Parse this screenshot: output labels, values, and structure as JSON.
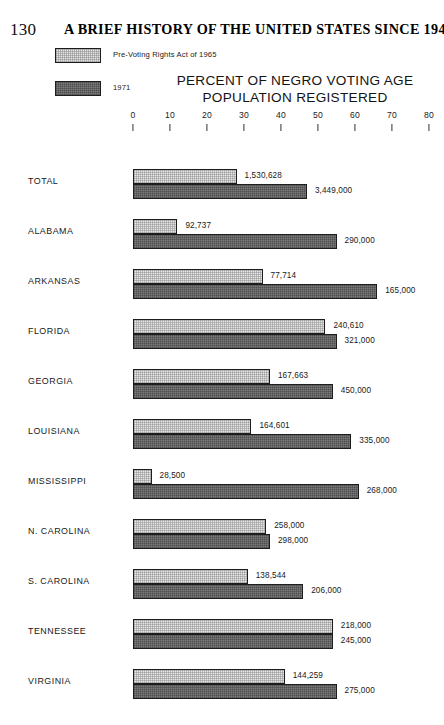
{
  "page": {
    "folio": "130",
    "running_head": "A BRIEF HISTORY OF THE UNITED STATES SINCE 1945"
  },
  "legend": {
    "items": [
      {
        "label": "Pre-Voting Rights Act of 1965",
        "swatch": "light-hatched-swatch"
      },
      {
        "label": "1971",
        "swatch": "dark-hatched-swatch"
      }
    ]
  },
  "chart_data": {
    "type": "bar",
    "orientation": "horizontal",
    "title": "PERCENT OF NEGRO VOTING AGE POPULATION REGISTERED",
    "title_line1": "PERCENT OF NEGRO VOTING AGE",
    "title_line2": "POPULATION REGISTERED",
    "xlabel": "",
    "ylabel": "",
    "xlim": [
      0,
      80
    ],
    "grid": false,
    "legend_position": "top-left",
    "tick_labels": [
      "0",
      "10",
      "20",
      "30",
      "40",
      "50",
      "60",
      "70",
      "80"
    ],
    "ticks": [
      0,
      10,
      20,
      30,
      40,
      50,
      60,
      70,
      80
    ],
    "categories": [
      "TOTAL",
      "ALABAMA",
      "ARKANSAS",
      "FLORIDA",
      "GEORGIA",
      "LOUISIANA",
      "MISSISSIPPI",
      "N. CAROLINA",
      "S. CAROLINA",
      "TENNESSEE",
      "VIRGINIA"
    ],
    "series": [
      {
        "name": "Pre-Voting Rights Act of 1965",
        "values": [
          28,
          12,
          35,
          52,
          37,
          32,
          5,
          36,
          31,
          54,
          41
        ],
        "data_labels": [
          "1,530,628",
          "92,737",
          "77,714",
          "240,610",
          "167,663",
          "164,601",
          "28,500",
          "258,000",
          "138,544",
          "218,000",
          "144,259"
        ]
      },
      {
        "name": "1971",
        "values": [
          47,
          55,
          66,
          55,
          54,
          59,
          61,
          37,
          46,
          54,
          55
        ],
        "data_labels": [
          "3,449,000",
          "290,000",
          "165,000",
          "321,000",
          "450,000",
          "335,000",
          "268,000",
          "298,000",
          "206,000",
          "245,000",
          "275,000"
        ]
      }
    ]
  }
}
